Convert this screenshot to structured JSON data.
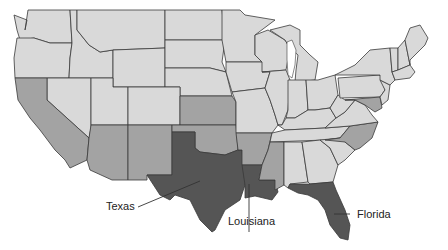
{
  "map": {
    "title": "United States map highlighting Gulf Coast states",
    "legend_colors": {
      "highlighted": "#555555",
      "secondary": "#a3a3a3",
      "other": "#d9d9d9",
      "border": "#3a3a3a",
      "background": "#ffffff"
    },
    "highlighted_states": [
      "Texas",
      "Louisiana",
      "Florida"
    ],
    "secondary_states": [
      "California",
      "Arizona",
      "New Mexico",
      "Kansas",
      "Oklahoma",
      "Arkansas",
      "Mississippi",
      "North Carolina",
      "Maryland"
    ],
    "labels": {
      "texas": "Texas",
      "louisiana": "Louisiana",
      "florida": "Florida"
    }
  }
}
